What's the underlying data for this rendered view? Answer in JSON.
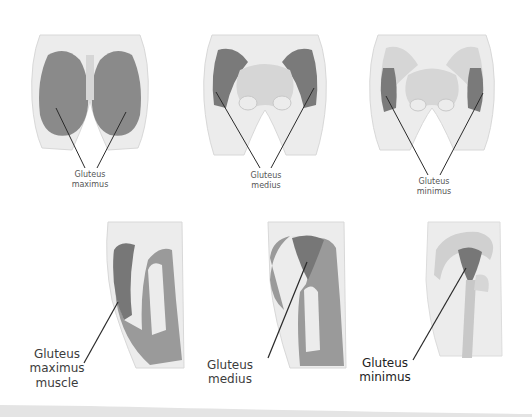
{
  "diagram": {
    "top_row": [
      {
        "view": "posterior",
        "label_line1": "Gluteus",
        "label_line2": "maximus"
      },
      {
        "view": "posterior",
        "label_line1": "Gluteus",
        "label_line2": "medius"
      },
      {
        "view": "posterior",
        "label_line1": "Gluteus",
        "label_line2": "minimus"
      }
    ],
    "bottom_row": [
      {
        "view": "lateral",
        "label_line1": "Gluteus",
        "label_line2": "maximus",
        "label_line3": "muscle"
      },
      {
        "view": "lateral",
        "label_line1": "Gluteus",
        "label_line2": "medius"
      },
      {
        "view": "lateral",
        "label_line1": "Gluteus",
        "label_line2": "minimus"
      }
    ],
    "colors": {
      "skin": "#ececec",
      "bone": "#d6d6d6",
      "muscle": "#8a8a8a",
      "muscle_dark": "#6e6e6e",
      "leader_line": "#2a2a2a",
      "text": "#4a4a4a"
    }
  }
}
